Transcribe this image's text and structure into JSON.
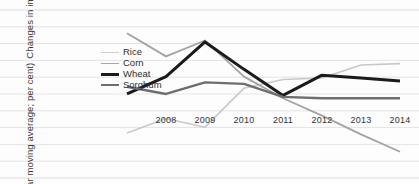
{
  "chart_data": {
    "type": "line",
    "title": "",
    "subtitle": "",
    "xlabel": "",
    "ylabel": "Changes in imports (3-year moving average; per cent)",
    "ylabel_line1": "Changes in imports",
    "ylabel_line2": "(3-year moving average; per cent)",
    "grid": true,
    "grid_orientation": "horizontal",
    "legend_position": "inside-left",
    "x": [
      2007,
      2008,
      2009,
      2010,
      2011,
      2012,
      2013,
      2014
    ],
    "xtick_labels": [
      "2008",
      "2009",
      "2010",
      "2011",
      "2012",
      "2013",
      "2014"
    ],
    "xtick_values": [
      2008,
      2009,
      2010,
      2011,
      2012,
      2013,
      2014
    ],
    "ylim": [
      -6,
      5
    ],
    "yaxis_ticks_visible": false,
    "series": [
      {
        "name": "Rice",
        "color": "#c9c9c9",
        "width": 1.6,
        "values": [
          -3.3,
          -2.3,
          -2.9,
          -0.2,
          0.4,
          0.5,
          1.4,
          1.5
        ]
      },
      {
        "name": "Corn",
        "color": "#a3a3a3",
        "width": 1.8,
        "values": [
          3.6,
          2.0,
          3.1,
          0.6,
          -0.9,
          -2.1,
          -3.4,
          -4.6
        ]
      },
      {
        "name": "Wheat",
        "color": "#1b1b1b",
        "width": 3.0,
        "values": [
          -0.6,
          0.6,
          3.0,
          1.1,
          -0.7,
          0.7,
          0.5,
          0.3
        ]
      },
      {
        "name": "Sorghum",
        "color": "#6e6e6e",
        "width": 2.4,
        "values": [
          -0.1,
          -0.6,
          0.2,
          0.1,
          -0.8,
          -0.9,
          -0.9,
          -0.9
        ]
      }
    ],
    "gridline_count": 11,
    "background_color": "#fdfdfd",
    "gridline_color": "#d8d8d8"
  },
  "legend": {
    "items": [
      {
        "label": "Rice"
      },
      {
        "label": "Corn"
      },
      {
        "label": "Wheat"
      },
      {
        "label": "Sorghum"
      }
    ]
  }
}
